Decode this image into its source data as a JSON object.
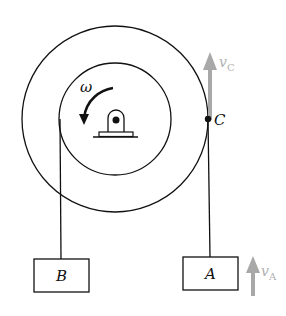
{
  "diagram": {
    "labels": {
      "omega": "ω",
      "point_c": "C",
      "block_a": "A",
      "block_b": "B",
      "vc_main": "v",
      "vc_sub": "C",
      "va_main": "v",
      "va_sub": "A"
    },
    "colors": {
      "line": "#111111",
      "velocity_arrow": "#a8a8a8",
      "velocity_label": "#b0b0b0",
      "background": "#ffffff"
    },
    "geometry": {
      "center": [
        115,
        119
      ],
      "outer_radius": 93,
      "inner_radius": 56
    }
  }
}
